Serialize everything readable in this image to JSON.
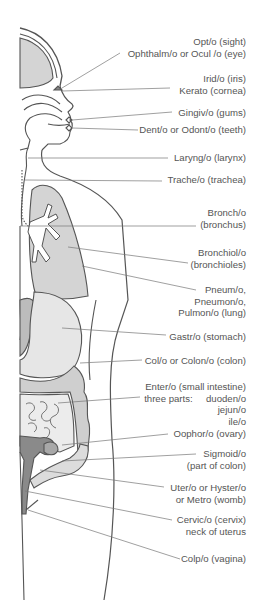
{
  "colors": {
    "outline": "#555555",
    "organ_fill": "#d4d4d4",
    "organ_fill_light": "#e6e6e6",
    "organ_fill_dark": "#a8a8a8",
    "reproductive_fill": "#8a8a8a",
    "label_text": "#555555",
    "leader_line": "#777777"
  },
  "labels": [
    {
      "id": "sight-eye",
      "lines": [
        "Opt/o (sight)",
        "Ophthalm/o or Ocul /o (eye)"
      ],
      "top": 36,
      "target": [
        60,
        88
      ]
    },
    {
      "id": "iris-cornea",
      "lines": [
        "Irid/o (iris)",
        "Kerato (cornea)"
      ],
      "top": 73,
      "target": [
        62,
        91
      ]
    },
    {
      "id": "gums",
      "lines": [
        "Gingiv/o (gums)"
      ],
      "top": 107,
      "target": [
        72,
        120
      ]
    },
    {
      "id": "teeth",
      "lines": [
        "Dent/o or Odont/o (teeth)"
      ],
      "top": 124,
      "target": [
        72,
        128
      ]
    },
    {
      "id": "larynx",
      "lines": [
        "Laryng/o (larynx)"
      ],
      "top": 152,
      "target": [
        28,
        158
      ]
    },
    {
      "id": "trachea",
      "lines": [
        "Trache/o (trachea)"
      ],
      "top": 174,
      "target": [
        25,
        180
      ]
    },
    {
      "id": "bronchus",
      "lines": [
        "Bronch/o",
        "(bronchus)"
      ],
      "top": 207,
      "target": [
        20,
        226
      ]
    },
    {
      "id": "bronchioles",
      "lines": [
        "Bronchiol/o",
        "(bronchioles)"
      ],
      "top": 247,
      "target": [
        68,
        247
      ]
    },
    {
      "id": "lung",
      "lines": [
        "Pneum/o,",
        "Pneumon/o,",
        "Pulmon/o (lung)"
      ],
      "top": 284,
      "target": [
        82,
        266
      ]
    },
    {
      "id": "stomach",
      "lines": [
        "Gastr/o (stomach)"
      ],
      "top": 331,
      "target": [
        62,
        328
      ]
    },
    {
      "id": "colon",
      "lines": [
        "Col/o or Colon/o (colon)"
      ],
      "top": 355,
      "target": [
        80,
        363
      ]
    },
    {
      "id": "small-intestine",
      "lines": [
        "Enter/o (small intestine)",
        "three parts:     duoden/o",
        "jejun/o",
        "ile/o"
      ],
      "top": 381,
      "target": [
        58,
        403
      ]
    },
    {
      "id": "ovary",
      "lines": [
        "Oophor/o (ovary)"
      ],
      "top": 428,
      "target": [
        62,
        445
      ]
    },
    {
      "id": "sigmoid",
      "lines": [
        "Sigmoid/o",
        "(part of colon)"
      ],
      "top": 448,
      "target": [
        62,
        461
      ]
    },
    {
      "id": "uterus",
      "lines": [
        "Uter/o or Hyster/o",
        "or Metro (womb)"
      ],
      "top": 482,
      "target": [
        40,
        470
      ]
    },
    {
      "id": "cervix",
      "lines": [
        "Cervic/o (cervix)",
        "neck of uterus"
      ],
      "top": 514,
      "target": [
        25,
        491
      ]
    },
    {
      "id": "vagina",
      "lines": [
        "Colp/o (vagina)"
      ],
      "top": 553,
      "target": [
        28,
        510
      ]
    }
  ]
}
